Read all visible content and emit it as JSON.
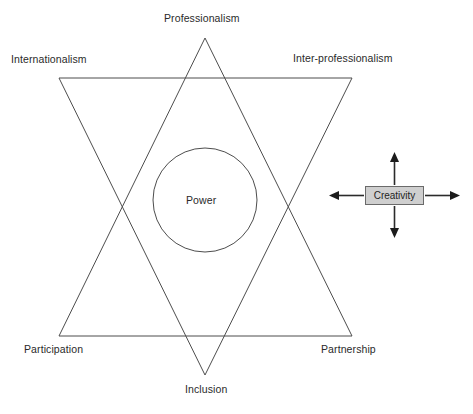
{
  "diagram": {
    "background_color": "#ffffff",
    "line_color": "#4d4d4d",
    "text_color": "#2a2a2a",
    "labels": {
      "professionalism": "Professionalism",
      "internationalism": "Internationalism",
      "interprofessionalism": "Inter-professionalism",
      "power": "Power",
      "participation": "Participation",
      "partnership": "Partnership",
      "inclusion": "Inclusion"
    },
    "creativity": {
      "label": "Creativity",
      "fill_color": "#cfcfcf",
      "border_color": "#6a6a6a",
      "arrow_color": "#1c1c1c",
      "arrow_directions": [
        "up",
        "right",
        "down",
        "left"
      ]
    },
    "geometry": {
      "upward_triangle_points": "205,38 352,336 59,336",
      "downward_triangle_points": "59,78 352,78 205,375",
      "circle": {
        "cx": 205,
        "cy": 200,
        "r": 52
      }
    }
  }
}
